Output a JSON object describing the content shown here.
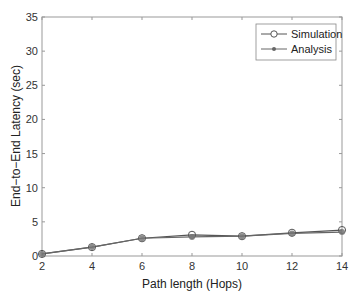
{
  "chart_data": {
    "type": "line",
    "title": "",
    "xlabel": "Path length (Hops)",
    "ylabel": "End−to−End Latency (sec)",
    "x": [
      2,
      4,
      6,
      8,
      10,
      12,
      14
    ],
    "xticks": [
      2,
      4,
      6,
      8,
      10,
      12,
      14
    ],
    "yticks": [
      0,
      5,
      10,
      15,
      20,
      25,
      30,
      35
    ],
    "xlim": [
      2,
      14
    ],
    "ylim": [
      0,
      35
    ],
    "grid": false,
    "legend_position": "upper right",
    "series": [
      {
        "name": "Simulation",
        "marker": "open-circle",
        "color": "#555555",
        "values": [
          0.3,
          1.3,
          2.6,
          3.1,
          2.9,
          3.4,
          3.8
        ]
      },
      {
        "name": "Analysis",
        "marker": "filled-star",
        "color": "#666666",
        "values": [
          0.3,
          1.3,
          2.6,
          2.8,
          2.9,
          3.3,
          3.5
        ]
      }
    ]
  }
}
